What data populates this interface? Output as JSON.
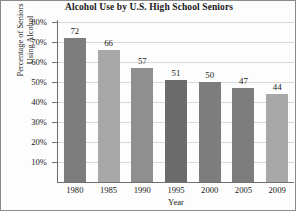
{
  "chart_data": {
    "type": "bar",
    "title": "Alcohol Use by U.S. High School Seniors",
    "xlabel": "Year",
    "ylabel_lines": [
      "Percentage of Seniors",
      "Using Alcohol"
    ],
    "ylabel": "Percentage of Seniors Using Alcohol",
    "categories": [
      "1980",
      "1985",
      "1990",
      "1995",
      "2000",
      "2005",
      "2009"
    ],
    "values": [
      72,
      66,
      57,
      51,
      50,
      47,
      44
    ],
    "value_labels": [
      "72",
      "66",
      "57",
      "51",
      "50",
      "47",
      "44"
    ],
    "bar_colors": [
      "#7d7d7d",
      "#a8a8a8",
      "#8f8f8f",
      "#6b6b6b",
      "#7d7d7d",
      "#7d7d7d",
      "#a8a8a8"
    ],
    "ylim": [
      0,
      80
    ],
    "ytick_values": [
      80,
      70,
      60,
      50,
      40,
      30,
      20,
      10
    ],
    "ytick_labels": [
      "80%",
      "70%",
      "60%",
      "50%",
      "40%",
      "30%",
      "20%",
      "10%"
    ],
    "grid": "horizontal",
    "grid_color": "#d9d9d9",
    "axis_color": "#6f6f6f",
    "legend": "none",
    "background": "#fdfdfd"
  }
}
